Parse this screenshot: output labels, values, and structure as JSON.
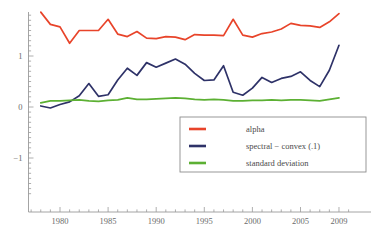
{
  "figure": {
    "top_caption": "",
    "background_color": "#ffffff"
  },
  "colors": {
    "alpha": "#e8442a",
    "spectral_convex": "#2e3268",
    "standard_deviation": "#5cb033",
    "axis": "#9a9a9a",
    "legend_border": "#8d8d8d",
    "tick_text": "#6b6b6b"
  },
  "legend": {
    "position": "bottom-right",
    "entries": [
      {
        "label": "alpha",
        "color_key": "alpha"
      },
      {
        "label": "spectral − convex (.1)",
        "color_key": "spectral_convex"
      },
      {
        "label": "standard deviation",
        "color_key": "standard_deviation"
      }
    ]
  },
  "axes": {
    "x": {
      "label": "",
      "tick_labels": [
        "1980",
        "1985",
        "1990",
        "1995",
        "2000",
        "2005",
        "2009"
      ],
      "tick_values": [
        1980,
        1985,
        1990,
        1995,
        2000,
        2005,
        2009
      ],
      "range": [
        1976.0,
        2010.0
      ],
      "minor_tick_step": 1
    },
    "y": {
      "label": "",
      "tick_labels": [
        "1",
        "0",
        "−1"
      ],
      "tick_values": [
        1,
        0,
        -1
      ],
      "range": [
        -1.75,
        1.95
      ],
      "minor_tick_step": 0.1
    },
    "grid": false
  },
  "chart_data": {
    "type": "line",
    "title": "",
    "xlabel": "",
    "ylabel": "",
    "xlim": [
      1976.0,
      2010.0
    ],
    "ylim": [
      -1.75,
      1.95
    ],
    "grid": false,
    "legend_position": "bottom-right",
    "x": [
      1978,
      1979,
      1980,
      1981,
      1982,
      1983,
      1984,
      1985,
      1986,
      1987,
      1988,
      1989,
      1990,
      1991,
      1992,
      1993,
      1994,
      1995,
      1996,
      1997,
      1998,
      1999,
      2000,
      2001,
      2002,
      2003,
      2004,
      2005,
      2006,
      2007,
      2008,
      2009
    ],
    "series": [
      {
        "name": "alpha",
        "color": "#e8442a",
        "values": [
          1.86,
          1.62,
          1.57,
          1.25,
          1.5,
          1.5,
          1.5,
          1.72,
          1.43,
          1.38,
          1.48,
          1.35,
          1.34,
          1.38,
          1.37,
          1.32,
          1.42,
          1.41,
          1.41,
          1.4,
          1.72,
          1.41,
          1.37,
          1.44,
          1.47,
          1.53,
          1.64,
          1.6,
          1.59,
          1.56,
          1.67,
          1.83
        ]
      },
      {
        "name": "spectral − convex (.1)",
        "color": "#2e3268",
        "values": [
          0.02,
          -0.02,
          0.05,
          0.1,
          0.22,
          0.46,
          0.21,
          0.24,
          0.53,
          0.76,
          0.62,
          0.87,
          0.78,
          0.86,
          0.94,
          0.84,
          0.66,
          0.52,
          0.53,
          0.81,
          0.29,
          0.23,
          0.37,
          0.58,
          0.48,
          0.56,
          0.6,
          0.69,
          0.52,
          0.4,
          0.72,
          1.21
        ]
      },
      {
        "name": "standard deviation",
        "color": "#5cb033",
        "values": [
          0.08,
          0.12,
          0.12,
          0.13,
          0.14,
          0.12,
          0.11,
          0.13,
          0.14,
          0.18,
          0.15,
          0.15,
          0.16,
          0.17,
          0.18,
          0.17,
          0.15,
          0.14,
          0.15,
          0.14,
          0.12,
          0.12,
          0.13,
          0.13,
          0.14,
          0.13,
          0.14,
          0.14,
          0.13,
          0.12,
          0.15,
          0.18
        ]
      }
    ]
  }
}
